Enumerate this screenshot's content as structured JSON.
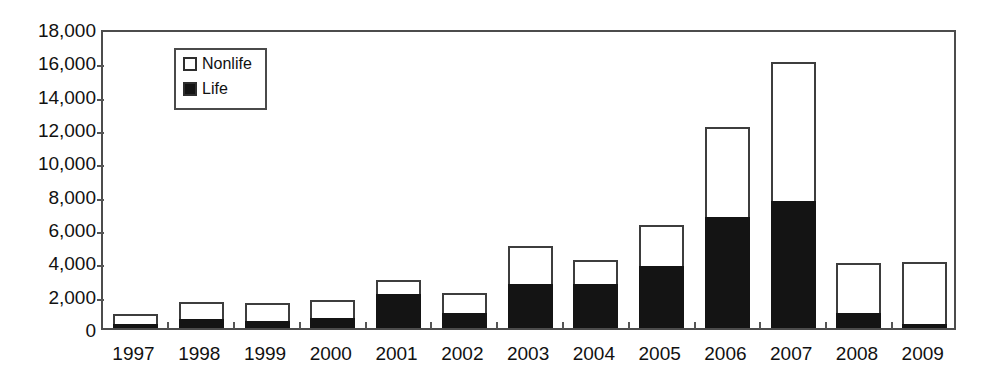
{
  "chart_data": {
    "type": "bar",
    "stacked": true,
    "title": "",
    "subtitle": "",
    "xlabel": "",
    "ylabel": "",
    "categories": [
      "1997",
      "1998",
      "1999",
      "2000",
      "2001",
      "2002",
      "2003",
      "2004",
      "2005",
      "2006",
      "2007",
      "2008",
      "2009"
    ],
    "series": [
      {
        "name": "Life",
        "color": "#141414",
        "values": [
          180,
          540,
          420,
          600,
          2040,
          900,
          2640,
          2640,
          3720,
          6660,
          7620,
          900,
          180
        ]
      },
      {
        "name": "Nonlife",
        "color": "#ffffff",
        "values": [
          660,
          1020,
          1080,
          1080,
          840,
          1200,
          2280,
          1440,
          2460,
          5400,
          8340,
          3000,
          3780
        ]
      }
    ],
    "totals": [
      840,
      1560,
      1500,
      1680,
      2880,
      2100,
      4920,
      4080,
      6180,
      12060,
      15960,
      3900,
      3960
    ],
    "ylim": [
      0,
      18000
    ],
    "yticks": [
      0,
      2000,
      4000,
      6000,
      8000,
      10000,
      12000,
      14000,
      16000,
      18000
    ],
    "ytick_labels": [
      "0",
      "2,000",
      "4,000",
      "6,000",
      "8,000",
      "10,000",
      "12,000",
      "14,000",
      "16,000",
      "18,000"
    ],
    "grid": false,
    "legend_position": "upper-left-inside",
    "legend_entries": [
      "Nonlife",
      "Life"
    ],
    "frame": true
  },
  "legend": {
    "items": [
      {
        "label": "Nonlife",
        "swatch": "hollow-square-icon"
      },
      {
        "label": "Life",
        "swatch": "filled-square-icon"
      }
    ]
  }
}
